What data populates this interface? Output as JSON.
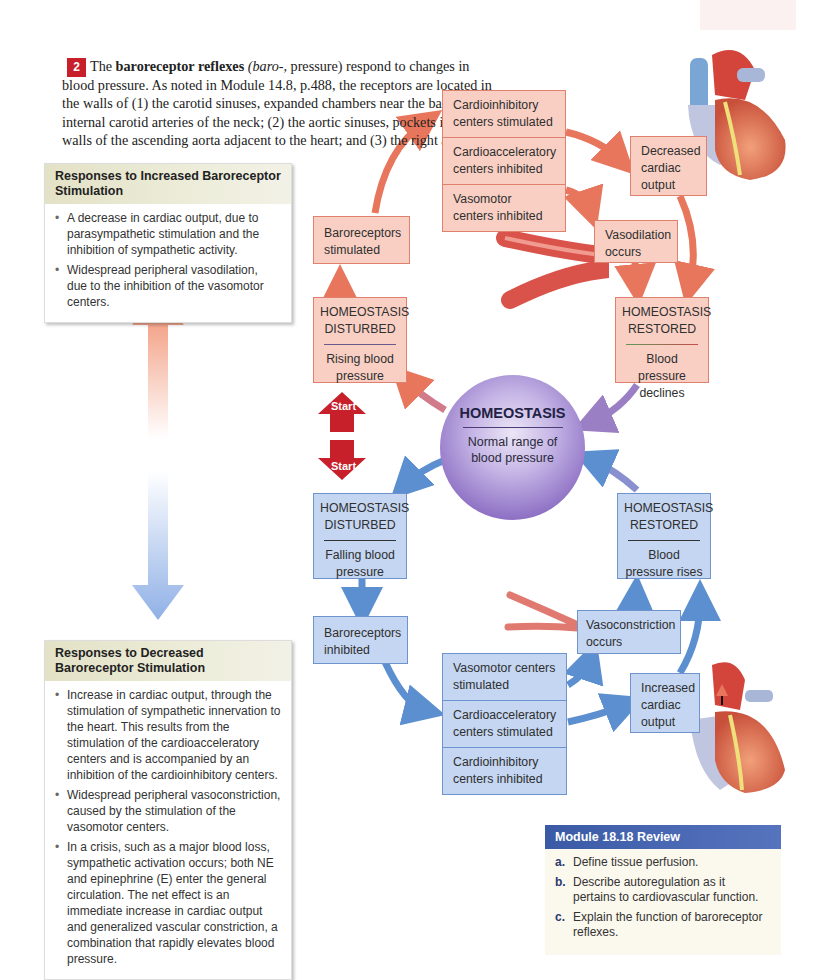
{
  "intro": {
    "step_number": "2",
    "text_before_bold": "The ",
    "bold_term": "baroreceptor reflexes",
    "italic_term": "(baro-,",
    "text_after": " pressure) respond to changes in blood pressure. As noted in Module 14.8, p.488, the receptors are located in the walls of (1) the carotid sinuses, expanded chambers near the bases of the internal carotid arteries of the neck; (2) the aortic sinuses, pockets in the walls of the ascending aorta adjacent to the heart; and (3) the right atrium."
  },
  "increased_panel": {
    "title": "Responses to Increased Baroreceptor Stimulation",
    "items": [
      "A decrease in cardiac output, due to parasympathetic stimulation and the inhibition of sympathetic activity.",
      "Widespread peripheral vasodilation, due to the inhibition of the vasomotor centers."
    ]
  },
  "decreased_panel": {
    "title": "Responses to Decreased Baroreceptor Stimulation",
    "items": [
      "Increase in cardiac output, through the stimulation of sympathetic innervation to the heart. This results from the stimulation of the cardioacceleratory centers and is accompanied by an inhibition of the cardioinhibitory centers.",
      "Widespread peripheral vasoconstriction, caused by the stimulation of the vasomotor centers.",
      "In a crisis, such as a major blood loss, sympathetic activation occurs; both NE and epinephrine (E) enter the general circulation. The net effect is an immediate increase in cardiac output and generalized vascular constriction, a combination that rapidly elevates blood pressure."
    ]
  },
  "top_loop": {
    "stack": [
      "Cardioinhibitory centers stimulated",
      "Cardioacceleratory centers inhibited",
      "Vasomotor centers inhibited"
    ],
    "baroreceptors": "Baroreceptors stimulated",
    "decreased_output": "Decreased cardiac output",
    "vasodilation": "Vasodilation occurs",
    "disturbed": {
      "title": "HOMEOSTASIS DISTURBED",
      "sub": "Rising blood pressure"
    },
    "restored": {
      "title": "HOMEOSTASIS RESTORED",
      "sub": "Blood pressure declines"
    }
  },
  "center": {
    "title": "HOMEOSTASIS",
    "subtitle": "Normal range of blood pressure"
  },
  "start_labels": {
    "up": "Start",
    "down": "Start"
  },
  "bottom_loop": {
    "disturbed": {
      "title": "HOMEOSTASIS DISTURBED",
      "sub": "Falling blood pressure"
    },
    "restored": {
      "title": "HOMEOSTASIS RESTORED",
      "sub": "Blood pressure rises"
    },
    "baroreceptors": "Baroreceptors inhibited",
    "vasoconstriction": "Vasoconstriction occurs",
    "increased_output": "Increased cardiac output",
    "stack": [
      "Vasomotor centers stimulated",
      "Cardioacceleratory centers stimulated",
      "Cardioinhibitory centers inhibited"
    ]
  },
  "review": {
    "title": "Module 18.18 Review",
    "items": [
      {
        "letter": "a.",
        "text": "Define tissue perfusion."
      },
      {
        "letter": "b.",
        "text": "Describe autoregulation as it pertains to cardiovascular function."
      },
      {
        "letter": "c.",
        "text": "Explain the function of baroreceptor reflexes."
      }
    ]
  },
  "colors": {
    "pink_box": "#f9cfc4",
    "pink_border": "#e0806e",
    "blue_box": "#c4d6f2",
    "blue_border": "#6f93cc",
    "red_arrow": "#e8765c",
    "blue_arrow": "#5b8fd0",
    "start_red": "#c8202a",
    "review_header": "#3b5aa6"
  }
}
